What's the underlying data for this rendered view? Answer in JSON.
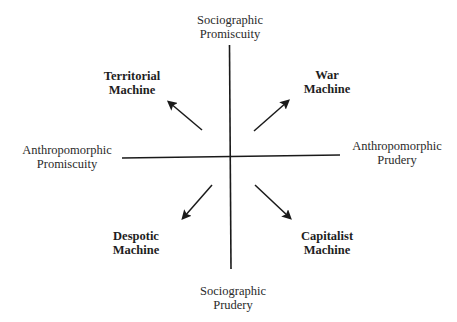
{
  "diagram": {
    "axes": {
      "top": {
        "line1": "Sociographic",
        "line2": "Promiscuity"
      },
      "bottom": {
        "line1": "Sociographic",
        "line2": "Prudery"
      },
      "left": {
        "line1": "Anthropomorphic",
        "line2": "Promiscuity"
      },
      "right": {
        "line1": "Anthropomorphic",
        "line2": "Prudery"
      }
    },
    "quadrants": {
      "top_left": {
        "line1": "Territorial",
        "line2": "Machine"
      },
      "top_right": {
        "line1": "War",
        "line2": "Machine"
      },
      "bottom_left": {
        "line1": "Despotic",
        "line2": "Machine"
      },
      "bottom_right": {
        "line1": "Capitalist",
        "line2": "Machine"
      }
    },
    "colors": {
      "line": "#1a1a1a",
      "text": "#2a2a2a"
    }
  }
}
